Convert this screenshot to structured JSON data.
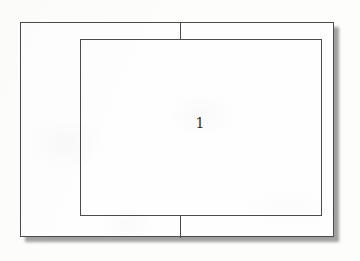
{
  "figure": {
    "background_color": "#fdfdfc",
    "line_color": "#4b4b4b",
    "shadow_color": "#8c8c8c",
    "label_color": "#2e2e2e",
    "outer_rect": {
      "name": "outer boundary rectangle",
      "x": 20,
      "y": 22,
      "width": 314,
      "height": 215,
      "stroke_width": 1
    },
    "inner_rect": {
      "name": "inner region rectangle",
      "x": 80,
      "y": 39,
      "width": 242,
      "height": 177,
      "stroke_width": 1
    },
    "tick_lines": [
      {
        "name": "top connector tick",
        "x": 180,
        "y": 22,
        "length": 18,
        "orientation": "vertical"
      },
      {
        "name": "bottom connector tick",
        "x": 180,
        "y": 215,
        "length": 23,
        "orientation": "vertical"
      }
    ],
    "labels": [
      {
        "name": "region-1-label",
        "text": "1",
        "x": 196,
        "y": 124
      }
    ],
    "shadow": {
      "offset_x": 5,
      "offset_y": 5,
      "blur": 1.6,
      "edges": "right and bottom"
    }
  }
}
